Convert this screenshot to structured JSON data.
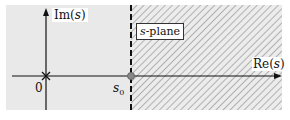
{
  "diagram": {
    "title": "s-plane",
    "axes": {
      "imag_label_prefix": "Im(",
      "imag_var": "s",
      "imag_label_suffix": ")",
      "real_label_prefix": "Re(",
      "real_var": "s",
      "real_label_suffix": ")"
    },
    "origin_label": "0",
    "point_label_var": "s",
    "point_label_sub": "0",
    "plane_label_var": "s",
    "plane_label_suffix": "-plane",
    "colors": {
      "background": "#e8e8e8",
      "hatch": "#555555",
      "axis": "#111111",
      "point": "#888888"
    }
  }
}
